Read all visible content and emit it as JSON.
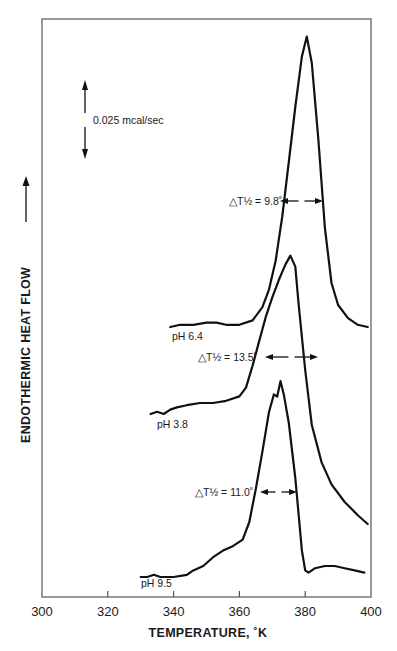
{
  "chart_data": {
    "type": "line",
    "title": "",
    "xlabel": "TEMPERATURE, °K",
    "ylabel": "ENDOTHERMIC HEAT FLOW",
    "xlim": [
      300,
      400
    ],
    "x_ticks": [
      300,
      320,
      340,
      360,
      380,
      400
    ],
    "x_tick_labels": [
      "300",
      "320",
      "340",
      "360",
      "380",
      "400"
    ],
    "y_ticks": [],
    "grid": false,
    "scale_bar": {
      "label": "0.025 mcal/sec",
      "value": 0.025,
      "units": "mcal/sec"
    },
    "y_units_note": "relative heat flow (curves offset vertically); arbitrary units, scale-bar = 0.025 mcal/sec",
    "series": [
      {
        "name": "pH 6.4",
        "label": "pH 6.4",
        "half_width_label": "ΔT½ = 9.8°",
        "half_width": 9.8,
        "x": [
          339,
          342,
          346,
          350,
          353,
          356,
          360,
          364,
          367,
          369,
          371,
          373,
          375,
          377,
          379,
          380.5,
          382,
          384,
          386,
          388,
          390,
          393,
          396,
          399
        ],
        "y": [
          0.0,
          0.001,
          0.001,
          0.002,
          0.002,
          0.001,
          0.001,
          0.003,
          0.009,
          0.017,
          0.03,
          0.05,
          0.075,
          0.1,
          0.123,
          0.132,
          0.12,
          0.085,
          0.045,
          0.02,
          0.01,
          0.004,
          0.001,
          0.0
        ]
      },
      {
        "name": "pH 3.8",
        "label": "pH 3.8",
        "half_width_label": "ΔT½ = 13.5°",
        "half_width": 13.5,
        "x": [
          333,
          335,
          337,
          339,
          341,
          344,
          348,
          352,
          356,
          360,
          362,
          364,
          366,
          368,
          370,
          372,
          374,
          375.5,
          377,
          378,
          380,
          382,
          385,
          388,
          392,
          396,
          399
        ],
        "y": [
          0.0,
          0.001,
          0.0,
          0.002,
          0.003,
          0.004,
          0.005,
          0.005,
          0.006,
          0.008,
          0.012,
          0.022,
          0.033,
          0.044,
          0.053,
          0.061,
          0.068,
          0.072,
          0.067,
          0.05,
          0.02,
          -0.005,
          -0.022,
          -0.032,
          -0.04,
          -0.046,
          -0.05
        ]
      },
      {
        "name": "pH 9.5",
        "label": "pH 9.5",
        "half_width_label": "ΔT½ = 11.0°",
        "half_width": 11.0,
        "x": [
          330,
          332,
          334,
          336,
          340,
          344,
          346,
          349,
          352,
          355,
          358,
          361,
          363,
          365,
          367,
          369,
          370.5,
          371.5,
          372.5,
          373.5,
          375,
          377,
          379,
          380,
          381,
          383,
          386,
          389,
          392,
          395,
          398
        ],
        "y": [
          0.0,
          0.0,
          0.001,
          0.0,
          0.0,
          0.001,
          0.003,
          0.005,
          0.009,
          0.012,
          0.014,
          0.017,
          0.025,
          0.04,
          0.057,
          0.075,
          0.083,
          0.082,
          0.089,
          0.083,
          0.07,
          0.045,
          0.012,
          0.003,
          0.002,
          0.004,
          0.005,
          0.005,
          0.004,
          0.003,
          0.002
        ]
      }
    ]
  },
  "labels": {
    "x_axis_title": "TEMPERATURE, ˚K",
    "y_axis_title": "ENDOTHERMIC HEAT FLOW",
    "scale_bar": "0.025 mcal/sec",
    "curves": [
      {
        "name": "pH 6.4",
        "width": "△T½ = 9.8˚"
      },
      {
        "name": "pH 3.8",
        "width": "△T½ = 13.5˚"
      },
      {
        "name": "pH 9.5",
        "width": "△T½ = 11.0˚"
      }
    ]
  }
}
